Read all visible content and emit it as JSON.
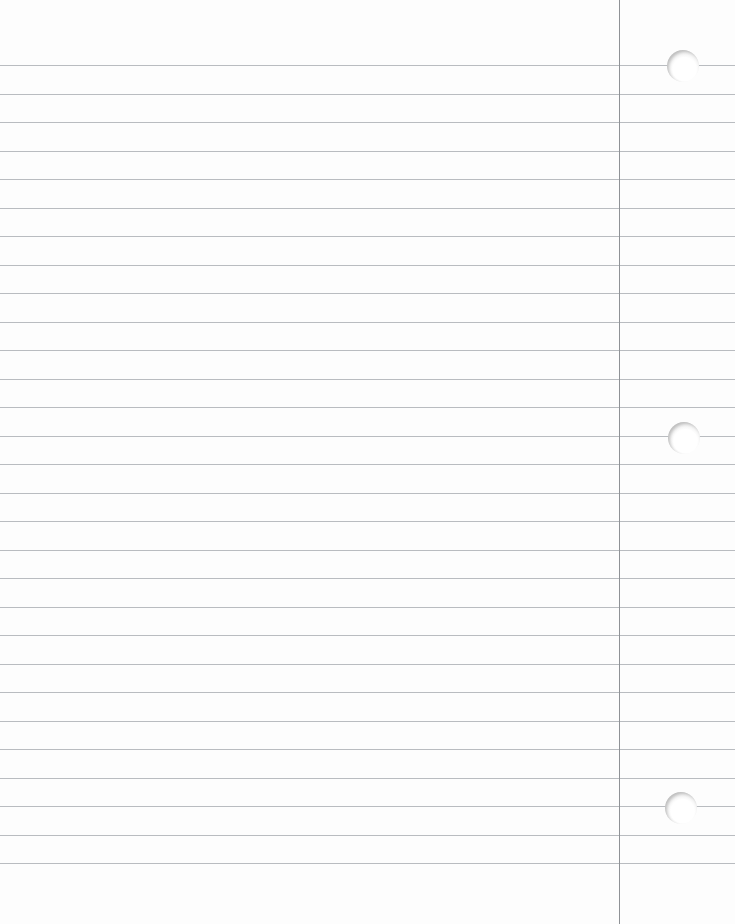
{
  "paper": {
    "type": "ruled-notebook-paper",
    "background": "#fdfdfd",
    "rule_color": "#b9bcc0",
    "margin_color": "#8f9296",
    "margin_x": 619,
    "rule_start_y": 65,
    "rule_spacing": 28.5,
    "rule_count": 29,
    "holes": [
      {
        "cx": 683,
        "cy": 66
      },
      {
        "cx": 684,
        "cy": 438
      },
      {
        "cx": 681,
        "cy": 808
      }
    ]
  }
}
